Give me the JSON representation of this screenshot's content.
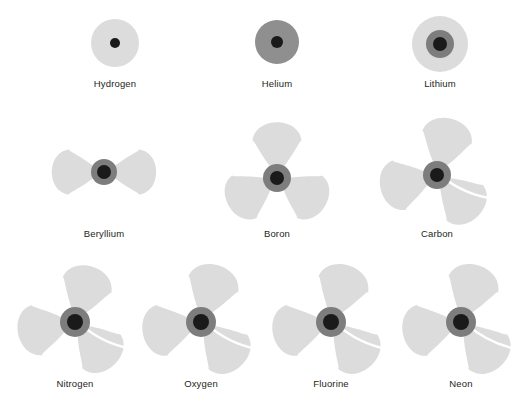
{
  "figure": {
    "background_color": "#ffffff",
    "width": 521,
    "height": 404,
    "label_color": "#231f20"
  },
  "palette": {
    "cloud": "#dcdcdc",
    "cloud_edge": "#d2d2d2",
    "shell_inner": "#8f8f8f",
    "nucleus_ring": "#7d7d7d",
    "nucleus": "#1a1a1a",
    "divider": "#ffffff"
  },
  "chart_data": {
    "type": "diagram",
    "title": "",
    "rows": 3,
    "columns": [
      3,
      3,
      4
    ],
    "elements": [
      {
        "name": "Hydrogen",
        "atomic_number": 1,
        "shape": "sphere",
        "cloud_radius": 24,
        "nucleus_radius": 5,
        "shell_radius": 0,
        "cx": 115,
        "cy": 43,
        "label_y": 78
      },
      {
        "name": "Helium",
        "atomic_number": 2,
        "shape": "sphere",
        "cloud_radius": 22,
        "nucleus_radius": 6,
        "shell_radius": 0,
        "cx": 277,
        "cy": 42,
        "label_y": 78,
        "cloud_color": "#8f8f8f"
      },
      {
        "name": "Lithium",
        "atomic_number": 3,
        "shape": "sphere",
        "cloud_radius": 28,
        "nucleus_radius": 7,
        "shell_radius": 14,
        "cx": 440,
        "cy": 44,
        "label_y": 78
      },
      {
        "name": "Beryllium",
        "atomic_number": 4,
        "shape": "lobes",
        "lobe_count": 2,
        "lobe_angles": [
          180,
          0
        ],
        "lobe_length": 45,
        "lobe_width": 46,
        "nucleus_radius": 7,
        "shell_radius": 13,
        "cx": 104,
        "cy": 172,
        "label_y": 228
      },
      {
        "name": "Boron",
        "atomic_number": 5,
        "shape": "lobes",
        "lobe_count": 3,
        "lobe_angles": [
          270,
          30,
          150
        ],
        "lobe_length": 48,
        "lobe_width": 50,
        "nucleus_radius": 7,
        "shell_radius": 14,
        "cx": 277,
        "cy": 178,
        "label_y": 228
      },
      {
        "name": "Carbon",
        "atomic_number": 6,
        "shape": "lobes",
        "lobe_count": 3,
        "lobe_angles": [
          285,
          45,
          165
        ],
        "lobe_length": 50,
        "lobe_width": 52,
        "nucleus_radius": 7,
        "shell_radius": 14,
        "cx": 437,
        "cy": 175,
        "label_y": 228,
        "divider": true
      },
      {
        "name": "Nitrogen",
        "atomic_number": 7,
        "shape": "lobes",
        "lobe_count": 3,
        "lobe_angles": [
          288,
          48,
          168
        ],
        "lobe_length": 50,
        "lobe_width": 52,
        "nucleus_radius": 8,
        "shell_radius": 15,
        "cx": 75,
        "cy": 322,
        "label_y": 378,
        "divider": true
      },
      {
        "name": "Oxygen",
        "atomic_number": 8,
        "shape": "lobes",
        "lobe_count": 3,
        "lobe_angles": [
          288,
          48,
          168
        ],
        "lobe_length": 51,
        "lobe_width": 53,
        "nucleus_radius": 8,
        "shell_radius": 15,
        "cx": 201,
        "cy": 322,
        "label_y": 378,
        "divider": true
      },
      {
        "name": "Fluorine",
        "atomic_number": 9,
        "shape": "lobes",
        "lobe_count": 3,
        "lobe_angles": [
          288,
          48,
          168
        ],
        "lobe_length": 51,
        "lobe_width": 53,
        "nucleus_radius": 8,
        "shell_radius": 15,
        "cx": 331,
        "cy": 322,
        "label_y": 378,
        "divider": true
      },
      {
        "name": "Neon",
        "atomic_number": 10,
        "shape": "lobes",
        "lobe_count": 3,
        "lobe_angles": [
          288,
          48,
          168
        ],
        "lobe_length": 51,
        "lobe_width": 53,
        "nucleus_radius": 8,
        "shell_radius": 15,
        "cx": 461,
        "cy": 322,
        "label_y": 378,
        "divider": true
      }
    ]
  }
}
